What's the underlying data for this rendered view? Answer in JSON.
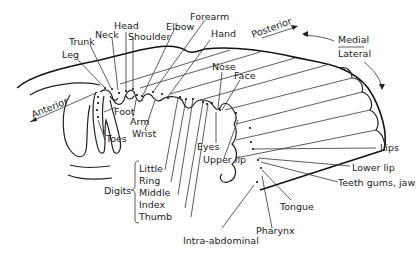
{
  "diagram": {
    "directions": {
      "anterior": "Anterior",
      "posterior": "Posterior",
      "medial": "Medial",
      "lateral": "Lateral"
    },
    "labels_top": [
      "Leg",
      "Trunk",
      "Neck",
      "Head",
      "Shoulder",
      "Elbow",
      "Forearm",
      "Hand",
      "Nose",
      "Face"
    ],
    "labels_inner": [
      "Foot",
      "Arm",
      "Wrist",
      "Toes",
      "Eyes",
      "Upper lip"
    ],
    "digits": {
      "group_label": "Digits",
      "items": [
        "Little",
        "Ring",
        "Middle",
        "Index",
        "Thumb"
      ]
    },
    "labels_right": [
      "Lips",
      "Lower lip",
      "Teeth gums, jaw",
      "Tongue",
      "Pharynx",
      "Intra-abdominal"
    ]
  }
}
